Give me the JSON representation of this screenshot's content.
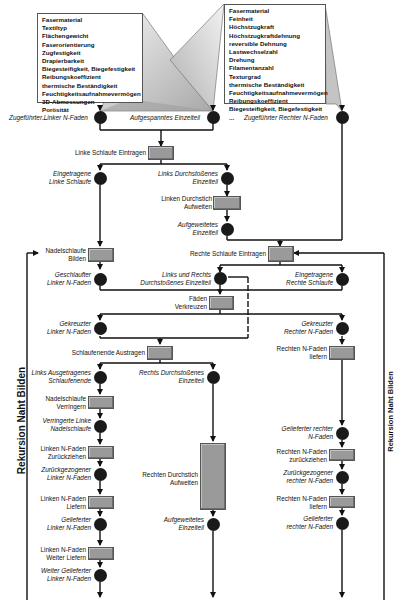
{
  "diagram": {
    "left_attributes": {
      "items": [
        "Fasermaterial",
        "Textiltyp",
        "Flächengewicht",
        "Faserorientierung",
        "Zugfestigkeit",
        "Drapierbarkeit",
        "Biegesteifigkeit, Biegefestigkeit",
        "Reibungskoeffizient",
        "thermische Beständigkeit",
        "Feuchtigkeitsaufnahmevermögen",
        "3D-Abmessungen",
        "Porösität",
        "..."
      ]
    },
    "right_attributes": {
      "items": [
        "Fasermaterial",
        "Feinheit",
        "Höchstzugkraft",
        "Höchstzugkraftdehnung",
        "reversible Dehnung",
        "Lastwechselzahl",
        "Drehung",
        "Filamentanzahl",
        "Texturgrad",
        "thermische Beständigkeit",
        "Feuchtigkeitsaufnahmevermögen",
        "Reibungskoeffizient",
        "Biegesteifigkeit, Biegefestigkeit",
        "..."
      ]
    },
    "states": {
      "s_left_thread": "Zugeführter Linker N-Faden",
      "s_clamped": "Aufgespanntes Einzelteil",
      "s_right_thread": "Zugeführter Rechter N-Faden",
      "s_left_loop": "Eingetragene\nLinke Schlaufe",
      "s_left_pierced_1": "Links Durchstoßenes",
      "s_left_pierced_2": "Einzelteil",
      "s_widened_1": "Aufgeweitetes",
      "s_widened_2": "Einzelteil",
      "s_looped_1": "Geschlaufter",
      "s_looped_2": "Linker N-Faden",
      "s_lr_pierced_1": "Links und Rechts",
      "s_lr_pierced_2": "Durchstoßenes Einzelteil",
      "s_right_loop_1": "Eingetragene",
      "s_right_loop_2": "Rechte Schlaufe",
      "s_crossed_left_1": "Gekreuzter",
      "s_crossed_left_2": "Linker N-Faden",
      "s_crossed_right_1": "Gekreuzter",
      "s_crossed_right_2": "Rechter N-Faden",
      "s_left_out_1": "Links Ausgetragenes",
      "s_left_out_2": "Schlaufenende",
      "s_right_pierced_1": "Rechts Durchstoßenes",
      "s_right_pierced_2": "Einzelteil",
      "s_reduced_1": "Verringerte Linke",
      "s_reduced_2": "Nadelschlaufe",
      "s_withdrawn_left_1": "Zurückgezogener",
      "s_withdrawn_left_2": "Linker N-Faden",
      "s_delivered_left_1": "Geliefertер",
      "s_delivered_left_2": "Linker N-Faden",
      "s_further_1": "Weiter Gelieferter",
      "s_further_2": "Linker N-Faden",
      "s_widened2_1": "Aufgeweitetes",
      "s_widened2_2": "Einzelteil",
      "s_delivered_right_a_1": "Gelieferter rechter",
      "s_delivered_right_a_2": "N-Faden",
      "s_withdrawn_right_1": "Zurückgezogener",
      "s_withdrawn_right_2": "rechter N-Faden",
      "s_delivered_right_b_1": "Gelieferter",
      "s_delivered_right_b_2": "rechter N-Faden"
    },
    "processes": {
      "p_left_loop": "Linke Schlaufe Eintragen",
      "p_widen_left_1": "Linken Durchstich",
      "p_widen_left_2": "Aufweiten",
      "p_needle_loop_1": "Nadelschlaufe",
      "p_needle_loop_2": "Bilden",
      "p_right_loop": "Rechte Schlaufe Eintragen",
      "p_cross_1": "Fäden",
      "p_cross_2": "Verkreuzen",
      "p_loop_end": "Schlaufenende Austragen",
      "p_right_deliver_1": "Rechten N-Faden",
      "p_right_deliver_2": "liefern",
      "p_reduce_1": "Nadelschlaufe",
      "p_reduce_2": "Verringern",
      "p_withdraw_left_1": "Linken N-Faden",
      "p_withdraw_left_2": "Zurückziehen",
      "p_widen_right_1": "Rechten Durchstich",
      "p_widen_right_2": "Aufweiten",
      "p_deliver_left_1": "Linken N-Faden",
      "p_deliver_left_2": "Liefern",
      "p_withdraw_right_1": "Rechten N-Faden",
      "p_withdraw_right_2": "zurückziehen",
      "p_deliver_more_1": "Linken N-Faden",
      "p_deliver_more_2": "Weiter Liefern",
      "p_deliver_right2_1": "Rechten N-Faden",
      "p_deliver_right2_2": "liefern"
    },
    "recursion_left": "Rekursion Naht Bilden",
    "recursion_right": "Rekursion Naht Bilden"
  }
}
